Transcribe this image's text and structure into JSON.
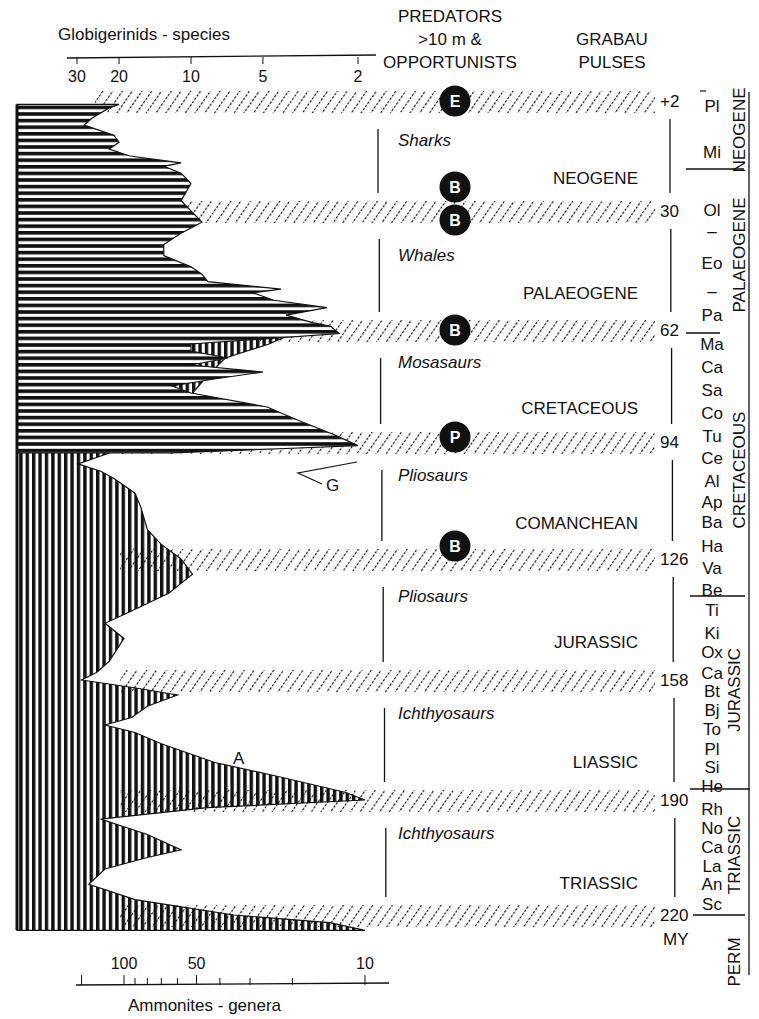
{
  "chart_data": {
    "type": "area",
    "title": "",
    "top_axis": {
      "label": "Globigerinids - species",
      "scale": "log",
      "ticks": [
        30,
        20,
        10,
        5,
        2
      ],
      "tick_labels": [
        "30",
        "20",
        "10",
        "5",
        "2"
      ],
      "range": [
        35,
        1.7
      ]
    },
    "bottom_axis": {
      "label": "Ammonites - genera",
      "scale": "log",
      "ticks": [
        150,
        100,
        90,
        80,
        70,
        60,
        50,
        40,
        30,
        20,
        10
      ],
      "tick_labels": [
        "",
        "100",
        "",
        "",
        "",
        "",
        "50",
        "",
        "",
        "",
        "10"
      ],
      "range": [
        200,
        8
      ]
    },
    "y_axis": {
      "label": "MY",
      "range": [
        -2,
        225
      ],
      "direction": "down"
    },
    "columns": {
      "predators_header": [
        "PREDATORS",
        ">10 m &",
        "OPPORTUNISTS"
      ],
      "grabau_header": [
        "GRABAU",
        "PULSES"
      ]
    },
    "pulses": [
      {
        "age": -2,
        "label": "+2"
      },
      {
        "age": 30,
        "label": "30"
      },
      {
        "age": 62,
        "label": "62"
      },
      {
        "age": 94,
        "label": "94"
      },
      {
        "age": 126,
        "label": "126"
      },
      {
        "age": 158,
        "label": "158"
      },
      {
        "age": 190,
        "label": "190"
      },
      {
        "age": 220,
        "label": "220"
      }
    ],
    "age_unit_label": "MY",
    "markers": [
      {
        "age": -2,
        "letter": "E"
      },
      {
        "age": 26,
        "letter": "B"
      },
      {
        "age": 33,
        "letter": "B"
      },
      {
        "age": 62,
        "letter": "B"
      },
      {
        "age": 94,
        "letter": "P"
      },
      {
        "age": 126,
        "letter": "B"
      }
    ],
    "predators": [
      {
        "age": 4,
        "name": "Sharks"
      },
      {
        "age": 37,
        "name": "Whales"
      },
      {
        "age": 66,
        "name": "Mosasaurs"
      },
      {
        "age": 98,
        "name": "Pliosaurs"
      },
      {
        "age": 131,
        "name": "Pliosaurs"
      },
      {
        "age": 162,
        "name": "Ichthyosaurs"
      },
      {
        "age": 194,
        "name": "Ichthyosaurs"
      }
    ],
    "eras": [
      {
        "age": 14,
        "name": "NEOGENE"
      },
      {
        "age": 46,
        "name": "PALAEOGENE"
      },
      {
        "age": 78,
        "name": "CRETACEOUS"
      },
      {
        "age": 110,
        "name": "COMANCHEAN"
      },
      {
        "age": 142,
        "name": "JURASSIC"
      },
      {
        "age": 174,
        "name": "LIASSIC"
      },
      {
        "age": 206,
        "name": "TRIASSIC"
      }
    ],
    "stages": [
      "Pl",
      "Mi",
      "Ol",
      "–",
      "Eo",
      "–",
      "Pa",
      "Ma",
      "Ca",
      "Sa",
      "Co",
      "Tu",
      "Ce",
      "Al",
      "Ap",
      "Ba",
      "Ha",
      "Va",
      "Be",
      "Ti",
      "Ki",
      "Ox",
      "Ca",
      "Bt",
      "Bj",
      "To",
      "Pl",
      "Si",
      "He",
      "Rh",
      "No",
      "Ca",
      "La",
      "An",
      "Sc"
    ],
    "periods": [
      "NEOGENE",
      "PALAEOGENE",
      "CRETACEOUS",
      "JURASSIC",
      "TRIASSIC",
      "PERM"
    ],
    "annotations": [
      {
        "text": "G",
        "age": 103,
        "note": "globigerinid peak pointer"
      },
      {
        "text": "A",
        "age": 177,
        "note": "ammonite curve label"
      }
    ],
    "series": [
      {
        "name": "Globigerinids species",
        "fill": "horizontal-hatch",
        "points": [
          [
            -1,
            20
          ],
          [
            0,
            22
          ],
          [
            3,
            26
          ],
          [
            5,
            28
          ],
          [
            8,
            21
          ],
          [
            10,
            20
          ],
          [
            12,
            22
          ],
          [
            14,
            18
          ],
          [
            16,
            11
          ],
          [
            17,
            13
          ],
          [
            19,
            11
          ],
          [
            22,
            10
          ],
          [
            27,
            11
          ],
          [
            30,
            10
          ],
          [
            33,
            9
          ],
          [
            36,
            11
          ],
          [
            39,
            13
          ],
          [
            42,
            13
          ],
          [
            45,
            10
          ],
          [
            47,
            9
          ],
          [
            49,
            8.5
          ],
          [
            51,
            4.2
          ],
          [
            52,
            5.5
          ],
          [
            54,
            4.5
          ],
          [
            56,
            2.7
          ],
          [
            58,
            4
          ],
          [
            60,
            3.1
          ],
          [
            61,
            2.6
          ],
          [
            62,
            2.5
          ],
          [
            63,
            2.4
          ],
          [
            66,
            10
          ],
          [
            68,
            10
          ],
          [
            70,
            7
          ],
          [
            72,
            10
          ],
          [
            74,
            5
          ],
          [
            76,
            8
          ],
          [
            78,
            12
          ],
          [
            80,
            10
          ],
          [
            84,
            4.8
          ],
          [
            88,
            3.5
          ],
          [
            92,
            2.5
          ],
          [
            95,
            2.0
          ],
          [
            97,
            12
          ]
        ]
      },
      {
        "name": "Ammonites genera",
        "fill": "vertical-hatch",
        "points": [
          [
            63,
            20
          ],
          [
            66,
            25
          ],
          [
            70,
            38
          ],
          [
            75,
            45
          ],
          [
            82,
            55
          ],
          [
            88,
            65
          ],
          [
            93,
            80
          ],
          [
            97,
            115
          ],
          [
            100,
            155
          ],
          [
            102,
            125
          ],
          [
            104,
            110
          ],
          [
            108,
            90
          ],
          [
            112,
            85
          ],
          [
            118,
            80
          ],
          [
            122,
            70
          ],
          [
            126,
            58
          ],
          [
            130,
            52
          ],
          [
            135,
            65
          ],
          [
            140,
            95
          ],
          [
            143,
            120
          ],
          [
            147,
            100
          ],
          [
            153,
            115
          ],
          [
            156,
            130
          ],
          [
            158,
            150
          ],
          [
            160,
            92
          ],
          [
            162,
            60
          ],
          [
            165,
            80
          ],
          [
            168,
            93
          ],
          [
            170,
            120
          ],
          [
            172,
            90
          ],
          [
            175,
            70
          ],
          [
            180,
            42
          ],
          [
            184,
            22
          ],
          [
            188,
            12
          ],
          [
            190,
            10
          ],
          [
            192,
            45
          ],
          [
            195,
            125
          ],
          [
            199,
            80
          ],
          [
            203,
            58
          ],
          [
            205,
            80
          ],
          [
            208,
            120
          ],
          [
            212,
            140
          ],
          [
            216,
            90
          ],
          [
            220,
            35
          ],
          [
            222,
            14
          ],
          [
            224,
            10
          ]
        ]
      }
    ]
  }
}
